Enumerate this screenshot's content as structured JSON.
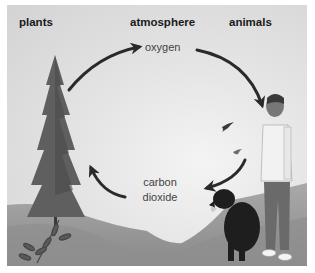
{
  "diagram": {
    "headers": {
      "plants": "plants",
      "atmosphere": "atmosphere",
      "animals": "animals"
    },
    "labels": {
      "oxygen": "oxygen",
      "carbon_dioxide_line1": "carbon",
      "carbon_dioxide_line2": "dioxide"
    },
    "flows": [
      {
        "from": "plants",
        "to": "atmosphere",
        "substance": "oxygen"
      },
      {
        "from": "atmosphere",
        "to": "animals",
        "substance": "oxygen"
      },
      {
        "from": "animals",
        "to": "atmosphere",
        "substance": "carbon dioxide"
      },
      {
        "from": "atmosphere",
        "to": "plants",
        "substance": "carbon dioxide"
      }
    ],
    "illustrations": [
      "pine-tree",
      "shrub",
      "hills",
      "birds",
      "dog",
      "man"
    ],
    "colors": {
      "arrow": "#2a2a2a",
      "sky": "#e4e4e4",
      "ground": "#9a9a9a"
    }
  }
}
